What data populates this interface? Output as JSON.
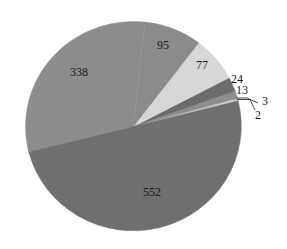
{
  "chart_data": {
    "type": "pie",
    "title": "",
    "total": 1104,
    "start_angle_deg": 14,
    "direction": "counterclockwise",
    "center": [
      133.5,
      126.5
    ],
    "radius": [
      108,
      105
    ],
    "slices": [
      {
        "label": "2",
        "value": 2,
        "color": "#a6a6a6",
        "label_pos": [
          258,
          119
        ],
        "leader": [
          [
            237,
            99.5
          ],
          [
            250,
            99.5
          ],
          [
            255,
            110
          ]
        ]
      },
      {
        "label": "3",
        "value": 3,
        "color": "#c9c9c9",
        "label_pos": [
          265,
          105
        ],
        "leader": [
          [
            236,
            98
          ],
          [
            247,
            98
          ],
          [
            258,
            103
          ]
        ]
      },
      {
        "label": "13",
        "value": 13,
        "color": "#8e8e8e",
        "label_pos": [
          242,
          94
        ]
      },
      {
        "label": "24",
        "value": 24,
        "color": "#6b6b6b",
        "label_pos": [
          237,
          83
        ]
      },
      {
        "label": "77",
        "value": 77,
        "color": "#d7d7d7",
        "label_pos": [
          202,
          69
        ]
      },
      {
        "label": "95",
        "value": 95,
        "color": "#8b8b8b",
        "label_pos": [
          163,
          49
        ]
      },
      {
        "label": "338",
        "value": 338,
        "color": "#8d8d8d",
        "label_pos": [
          79,
          76
        ]
      },
      {
        "label": "552",
        "value": 552,
        "color": "#6f6f6f",
        "label_pos": [
          152,
          196
        ]
      }
    ],
    "legend": null,
    "grid": false
  }
}
